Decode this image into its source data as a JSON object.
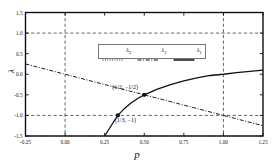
{
  "chart_data": {
    "type": "line",
    "title": "",
    "xlabel": "p",
    "ylabel": "λ",
    "xlim": [
      -0.25,
      1.25
    ],
    "ylim": [
      -1.5,
      1.5
    ],
    "xticks": [
      "-0.25",
      "0.00",
      "0.25",
      "0.50",
      "0.75",
      "1.00",
      "1.25"
    ],
    "xtick_values": [
      -0.25,
      0.0,
      0.25,
      0.5,
      0.75,
      1.0,
      1.25
    ],
    "yticks": [
      "1.5",
      "1.0",
      "0.5",
      "0.0",
      "-0.5",
      "-1.0",
      "-1.5"
    ],
    "ytick_values": [
      1.5,
      1.0,
      0.5,
      0.0,
      -0.5,
      -1.0,
      -1.5
    ],
    "grid": true,
    "gridlines_h": [
      1.0,
      -1.0
    ],
    "gridlines_v": [
      0.0,
      1.0
    ],
    "legend_position": "upper center",
    "series": [
      {
        "name": "λ3",
        "label_base": "λ",
        "label_sub": "3",
        "style": "dotted",
        "color": "#111111",
        "x": [
          -0.25,
          0.0,
          0.25,
          0.5,
          0.75,
          1.0,
          1.25
        ],
        "values": [
          -1.5,
          -1.5,
          -1.5,
          -1.5,
          -1.5,
          -1.5,
          -1.5
        ]
      },
      {
        "name": "λ2",
        "label_base": "λ",
        "label_sub": "2",
        "style": "dashdot",
        "color": "#111111",
        "x": [
          -0.25,
          0.0,
          0.25,
          0.3333,
          0.5,
          0.75,
          1.0,
          1.25
        ],
        "values": [
          0.25,
          0.0,
          -0.25,
          -0.3333,
          -0.5,
          -0.75,
          -1.0,
          -1.25
        ]
      },
      {
        "name": "λ1",
        "label_base": "λ",
        "label_sub": "1",
        "style": "solid",
        "color": "#111111",
        "x": [
          0.25,
          0.2778,
          0.3056,
          0.3333,
          0.375,
          0.4167,
          0.4583,
          0.5,
          0.5833,
          0.6667,
          0.75,
          0.8333,
          0.9167,
          1.0,
          1.0833,
          1.1667,
          1.25
        ],
        "values": [
          -1.5,
          -1.33,
          -1.16,
          -1.0,
          -0.83,
          -0.7,
          -0.59,
          -0.5,
          -0.36,
          -0.25,
          -0.16,
          -0.09,
          -0.03,
          0.0,
          0.04,
          0.07,
          0.1
        ]
      }
    ],
    "annotations": [
      {
        "text": "(1/2, −1/2)",
        "x": 0.5,
        "y": -0.5,
        "marker": true
      },
      {
        "text": "(1/3, −1)",
        "x": 0.3333,
        "y": -1.0,
        "marker": true
      }
    ]
  }
}
